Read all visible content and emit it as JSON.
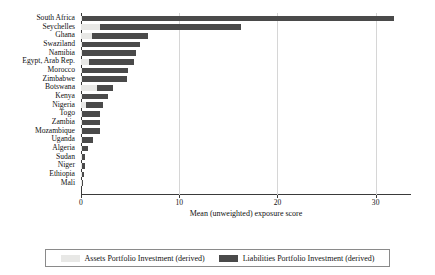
{
  "chart_data": {
    "type": "bar",
    "orientation": "horizontal",
    "stacked": true,
    "title": "",
    "xlabel": "Mean (unweighted) exposure score",
    "ylabel": "",
    "xlim": [
      0,
      33.6
    ],
    "xticks": [
      0,
      10,
      20,
      30
    ],
    "xtick_labels": [
      "0",
      "10",
      "20",
      "30"
    ],
    "grid": "vertical",
    "legend_position": "bottom",
    "categories": [
      "South Africa",
      "Seychelles",
      "Ghana",
      "Swaziland",
      "Namibia",
      "Egypt, Arab Rep.",
      "Morocco",
      "Zimbabwe",
      "Botswana",
      "Kenya",
      "Nigeria",
      "Togo",
      "Zambia",
      "Mozambique",
      "Uganda",
      "Algeria",
      "Sudan",
      "Niger",
      "Ethiopia",
      "Mali"
    ],
    "series": [
      {
        "name": "Assets Portfolio Investment (derived)",
        "color": "#e8e8e6",
        "values": [
          0.15,
          1.95,
          1.1,
          0.1,
          0.1,
          0.85,
          0.1,
          0.1,
          1.65,
          0.1,
          0.55,
          0.05,
          0.05,
          0.05,
          0.05,
          0.02,
          0.02,
          0.02,
          0.02,
          0.02
        ]
      },
      {
        "name": "Liabilities Portfolio Investment (derived)",
        "color": "#4a4a4a",
        "values": [
          31.75,
          14.35,
          5.7,
          5.9,
          5.5,
          4.55,
          4.7,
          4.6,
          1.65,
          2.6,
          1.65,
          1.85,
          1.85,
          1.85,
          1.15,
          0.68,
          0.38,
          0.33,
          0.23,
          0.13
        ]
      }
    ],
    "totals": [
      31.9,
      16.3,
      6.8,
      6.0,
      5.6,
      5.4,
      4.8,
      4.7,
      3.3,
      2.7,
      2.2,
      1.9,
      1.9,
      1.9,
      1.2,
      0.7,
      0.4,
      0.35,
      0.25,
      0.15
    ]
  },
  "legend": {
    "entries": [
      {
        "label": "Assets Portfolio Investment (derived)",
        "swatch": "assets"
      },
      {
        "label": "Liabilities Portfolio Investment (derived)",
        "swatch": "liab"
      }
    ]
  }
}
